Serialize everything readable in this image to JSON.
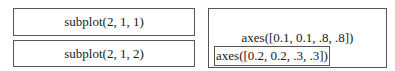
{
  "left_panel": {
    "subplot_top": "subplot(2, 1, 1)",
    "subplot_bottom": "subplot(2, 1, 2)"
  },
  "right_panel": {
    "outer_axes": "axes([0.1, 0.1, .8, .8])",
    "inner_axes": "axes([0.2, 0.2, .3, .3])"
  },
  "colors": {
    "border": "#555555",
    "text": "#1a1a1a",
    "background": "#ffffff"
  }
}
